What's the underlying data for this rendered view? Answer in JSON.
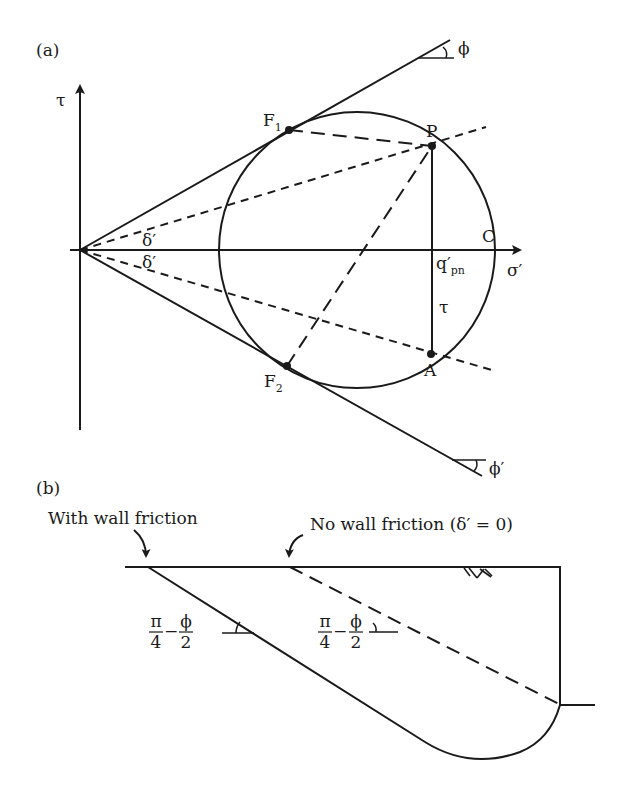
{
  "panel_a": {
    "label": "(a)",
    "axes": {
      "y_label": "τ",
      "x_label": "σ′"
    },
    "points": {
      "F1": {
        "main": "F",
        "sub": "1"
      },
      "F2": {
        "main": "F",
        "sub": "2"
      },
      "P": "P",
      "A": "A",
      "C": "C"
    },
    "q_label": {
      "main": "q′",
      "sub": "pn"
    },
    "tau_segment_label": "τ",
    "angle_labels": {
      "delta_upper": "δ′",
      "delta_lower": "δ′",
      "phi_upper": "ϕ",
      "phi_lower": "ϕ′"
    }
  },
  "panel_b": {
    "label": "(b)",
    "annotations": {
      "with_friction": "With wall friction",
      "no_friction": "No wall friction (δ′ = 0)"
    },
    "angle_fraction": {
      "num1": "π",
      "den1": "4",
      "minus": "−",
      "num2": "ϕ",
      "den2": "2"
    }
  },
  "colors": {
    "ink": "#1a1a1a",
    "background": "#ffffff"
  }
}
